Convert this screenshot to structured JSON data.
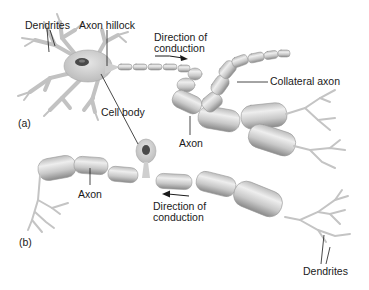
{
  "figure": {
    "panel_a": {
      "tag": "(a)",
      "labels": {
        "dendrites": "Dendrites",
        "axon_hillock": "Axon hillock",
        "direction_line1": "Direction of",
        "direction_line2": "conduction",
        "collateral_axon": "Collateral axon",
        "cell_body": "Cell body",
        "axon": "Axon"
      },
      "arrow_direction": "right"
    },
    "panel_b": {
      "tag": "(b)",
      "labels": {
        "axon": "Axon",
        "direction_line1": "Direction of",
        "direction_line2": "conduction",
        "dendrites": "Dendrites"
      },
      "arrow_direction": "left"
    },
    "colors": {
      "background": "#ffffff",
      "tissue_fill": "#d4d4d4",
      "tissue_dark": "#8a8a8a",
      "tissue_light": "#eeeeee",
      "nucleus": "#4a4a4a",
      "text": "#1a1a1a",
      "leader_line": "#1a1a1a"
    }
  }
}
